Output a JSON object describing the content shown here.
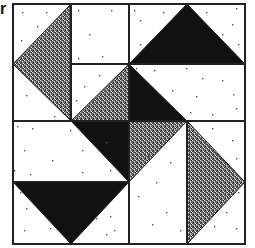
{
  "figure": {
    "label": "r",
    "colors": {
      "background": "#ffffff",
      "solid": "#111111",
      "stipple_dark": "#2a2a2a",
      "stipple_light": "#e8e8e8",
      "line": "#222222",
      "dot": "#555555"
    },
    "grid": {
      "x": [
        13,
        71,
        129,
        187,
        245
      ],
      "y": [
        4,
        64,
        121,
        182,
        244
      ]
    },
    "pieces": [
      {
        "name": "tl-left-stipple-triangle",
        "fill": "stipple",
        "points": "71,4 13,64 71,121"
      },
      {
        "name": "tl-center-stipple-triangle",
        "fill": "stipple",
        "points": "71,121 129,64 129,121"
      },
      {
        "name": "tr-top-black-triangle",
        "fill": "solid",
        "points": "129,64 187,4 245,64"
      },
      {
        "name": "tr-center-black-triangle",
        "fill": "solid",
        "points": "129,64 129,121 187,121"
      },
      {
        "name": "bl-center-black-triangle",
        "fill": "solid",
        "points": "71,121 129,121 129,182"
      },
      {
        "name": "bl-bottom-black-triangle",
        "fill": "solid",
        "points": "13,182 129,182 71,244"
      },
      {
        "name": "br-center-stipple-triangle",
        "fill": "stipple",
        "points": "129,121 187,121 129,182"
      },
      {
        "name": "br-right-stipple-triangle",
        "fill": "stipple",
        "points": "187,121 245,182 187,244"
      }
    ],
    "lines": [
      {
        "name": "tl-vertical-seam",
        "x1": 71,
        "y1": 4,
        "x2": 71,
        "y2": 121
      },
      {
        "name": "tl-horizontal-seam",
        "x1": 71,
        "y1": 64,
        "x2": 129,
        "y2": 64
      },
      {
        "name": "tr-horizontal-seam",
        "x1": 129,
        "y1": 64,
        "x2": 245,
        "y2": 64
      },
      {
        "name": "center-vertical-seam",
        "x1": 129,
        "y1": 4,
        "x2": 129,
        "y2": 244
      },
      {
        "name": "center-horizontal-seam",
        "x1": 13,
        "y1": 121,
        "x2": 245,
        "y2": 121
      },
      {
        "name": "bl-horizontal-seam",
        "x1": 13,
        "y1": 182,
        "x2": 129,
        "y2": 182
      },
      {
        "name": "br-vertical-seam",
        "x1": 187,
        "y1": 121,
        "x2": 187,
        "y2": 244
      }
    ],
    "dots": [
      [
        22,
        12
      ],
      [
        46,
        12
      ],
      [
        37,
        26
      ],
      [
        21,
        40
      ],
      [
        26,
        95
      ],
      [
        54,
        116
      ],
      [
        78,
        10
      ],
      [
        111,
        10
      ],
      [
        89,
        34
      ],
      [
        78,
        58
      ],
      [
        102,
        56
      ],
      [
        99,
        75
      ],
      [
        84,
        86
      ],
      [
        105,
        90
      ],
      [
        92,
        100
      ],
      [
        76,
        100
      ],
      [
        134,
        10
      ],
      [
        163,
        12
      ],
      [
        140,
        20
      ],
      [
        206,
        12
      ],
      [
        236,
        8
      ],
      [
        232,
        24
      ],
      [
        222,
        34
      ],
      [
        140,
        44
      ],
      [
        238,
        44
      ],
      [
        136,
        68
      ],
      [
        154,
        70
      ],
      [
        186,
        68
      ],
      [
        202,
        78
      ],
      [
        222,
        80
      ],
      [
        172,
        90
      ],
      [
        196,
        96
      ],
      [
        233,
        94
      ],
      [
        190,
        112
      ],
      [
        212,
        114
      ],
      [
        236,
        108
      ],
      [
        17,
        126
      ],
      [
        32,
        128
      ],
      [
        70,
        130
      ],
      [
        24,
        150
      ],
      [
        52,
        160
      ],
      [
        82,
        150
      ],
      [
        106,
        142
      ],
      [
        14,
        170
      ],
      [
        30,
        174
      ],
      [
        82,
        172
      ],
      [
        110,
        170
      ],
      [
        20,
        192
      ],
      [
        26,
        208
      ],
      [
        24,
        230
      ],
      [
        50,
        228
      ],
      [
        96,
        218
      ],
      [
        110,
        216
      ],
      [
        114,
        230
      ],
      [
        106,
        234
      ],
      [
        148,
        156
      ],
      [
        166,
        124
      ],
      [
        168,
        140
      ],
      [
        170,
        162
      ],
      [
        138,
        196
      ],
      [
        156,
        182
      ],
      [
        166,
        212
      ],
      [
        152,
        224
      ],
      [
        180,
        230
      ],
      [
        212,
        128
      ],
      [
        232,
        140
      ],
      [
        236,
        158
      ],
      [
        238,
        192
      ],
      [
        226,
        212
      ],
      [
        214,
        226
      ],
      [
        236,
        228
      ]
    ]
  }
}
